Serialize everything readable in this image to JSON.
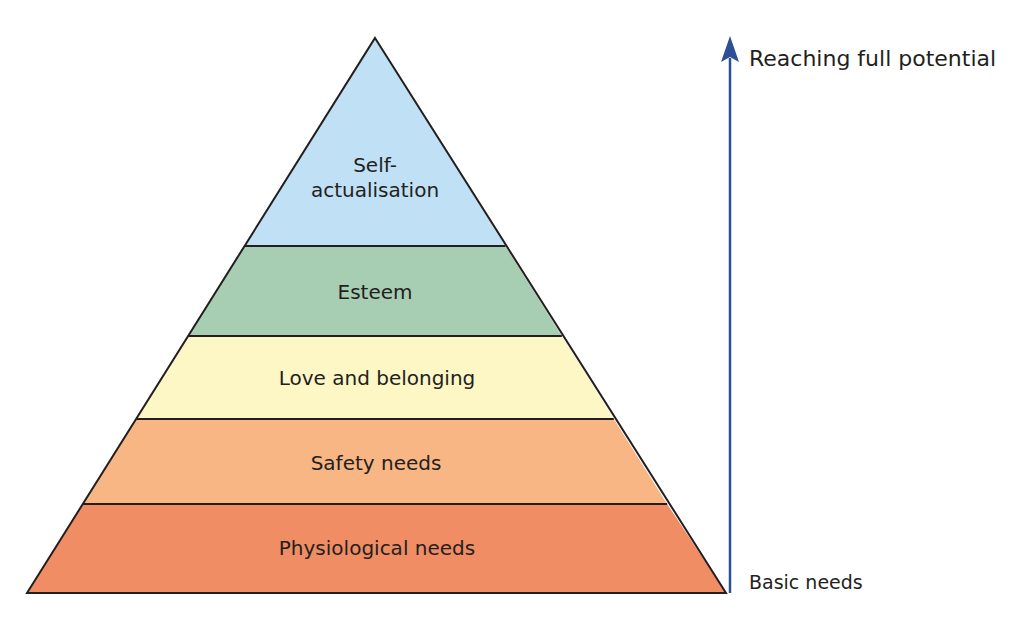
{
  "diagram": {
    "title": "",
    "levels": [
      {
        "label_line1": "Self-",
        "label_line2": "actualisation",
        "color": "#bfe0f5"
      },
      {
        "label": "Esteem",
        "color": "#a7cdb3"
      },
      {
        "label": "Love and belonging",
        "color": "#fdf6c5"
      },
      {
        "label": "Safety needs",
        "color": "#f7b683"
      },
      {
        "label": "Physiological needs",
        "color": "#f08d64"
      }
    ],
    "axis": {
      "top_label": "Reaching full potential",
      "bottom_label": "Basic needs",
      "arrow_color": "#2d4f96"
    },
    "outline_color": "#231f20"
  }
}
